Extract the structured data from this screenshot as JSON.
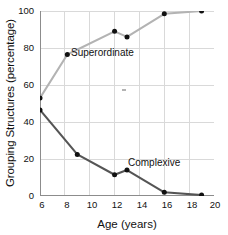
{
  "chart_data": {
    "type": "line",
    "title": "",
    "xlabel": "Age (years)",
    "ylabel": "Grouping Structures (percentage)",
    "xlim": [
      6,
      20
    ],
    "ylim": [
      0,
      100
    ],
    "xticks": [
      6,
      8,
      10,
      12,
      14,
      16,
      18,
      20
    ],
    "yticks": [
      0,
      20,
      40,
      60,
      80,
      100
    ],
    "grid": true,
    "legend_position": "inline-annotations",
    "series": [
      {
        "name": "Superordinate",
        "color": "#b3b3b3",
        "marker_color": "#111111",
        "x": [
          6,
          8.2,
          12,
          13,
          16,
          19
        ],
        "values": [
          53,
          76.5,
          89,
          86,
          98.5,
          100
        ]
      },
      {
        "name": "Complexive",
        "color": "#555555",
        "marker_color": "#111111",
        "x": [
          6,
          9,
          12,
          13,
          16,
          19
        ],
        "values": [
          46.5,
          22.5,
          11.5,
          14,
          2,
          0.5
        ]
      }
    ],
    "annotations": [
      {
        "text": "Superordinate",
        "x": 8.9,
        "y": 70
      },
      {
        "text": "Complexive",
        "x": 13.6,
        "y": 18
      }
    ]
  },
  "axes": {
    "y_tick_labels": [
      "100",
      "80",
      "60",
      "40",
      "20",
      "0"
    ],
    "x_tick_labels": [
      "6",
      "8",
      "10",
      "12",
      "14",
      "16",
      "18",
      "20"
    ],
    "x_title": "Age (years)",
    "y_title": "Grouping Structures (percentage)"
  },
  "labels": {
    "superordinate": "Superordinate",
    "complexive": "Complexive"
  },
  "colors": {
    "superordinate_line": "#b3b3b3",
    "complexive_line": "#555555",
    "marker": "#111111",
    "grid": "#d9d9d9",
    "frame": "#8c8c8c",
    "background": "#ffffff"
  }
}
